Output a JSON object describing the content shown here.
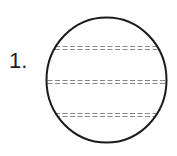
{
  "problem": {
    "number_label": "1.",
    "figure": {
      "shape": "circle",
      "dividers": 3,
      "divider_style": "double-dashed",
      "stroke_color": "#1a1a1a",
      "divider_color": "#888888"
    }
  }
}
